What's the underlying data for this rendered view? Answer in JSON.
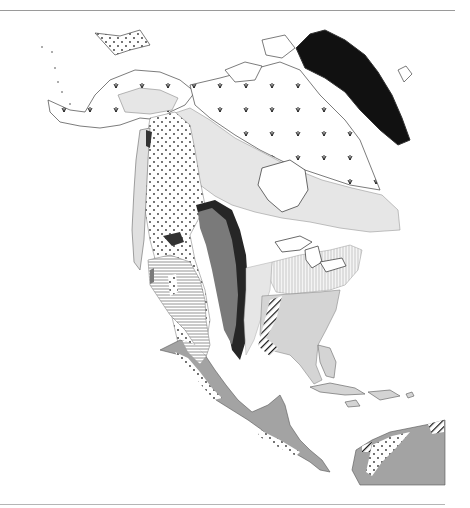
{
  "map": {
    "subject": "North America vegetation / biome regions",
    "legend_visible": false,
    "regions": [
      {
        "key": "ice_cap",
        "pattern": "solid",
        "color": "#111111"
      },
      {
        "key": "tundra",
        "pattern": "tuft-symbols",
        "color": "#ffffff"
      },
      {
        "key": "boreal_forest",
        "pattern": "solid",
        "color": "#e6e6e6"
      },
      {
        "key": "montane_coniferous",
        "pattern": "dots",
        "color": "#ffffff"
      },
      {
        "key": "desert_scrub",
        "pattern": "horizontal-lines",
        "color": "#ffffff"
      },
      {
        "key": "shortgrass_prairie",
        "pattern": "solid",
        "color": "#7a7a7a"
      },
      {
        "key": "tallgrass_prairie",
        "pattern": "solid",
        "color": "#262626"
      },
      {
        "key": "temperate_deciduous_forest",
        "pattern": "vertical-lines",
        "color": "#ffffff"
      },
      {
        "key": "southeastern_forest",
        "pattern": "solid",
        "color": "#d4d4d4"
      },
      {
        "key": "savanna_woodland",
        "pattern": "diagonal-lines",
        "color": "#ffffff"
      },
      {
        "key": "tropical_forest",
        "pattern": "solid",
        "color": "#a3a3a3"
      },
      {
        "key": "coastal_mountain_forest",
        "pattern": "solid",
        "color": "#333333"
      }
    ],
    "frame": {
      "top_rule_y": 10,
      "bottom_rule_y": 504
    }
  }
}
